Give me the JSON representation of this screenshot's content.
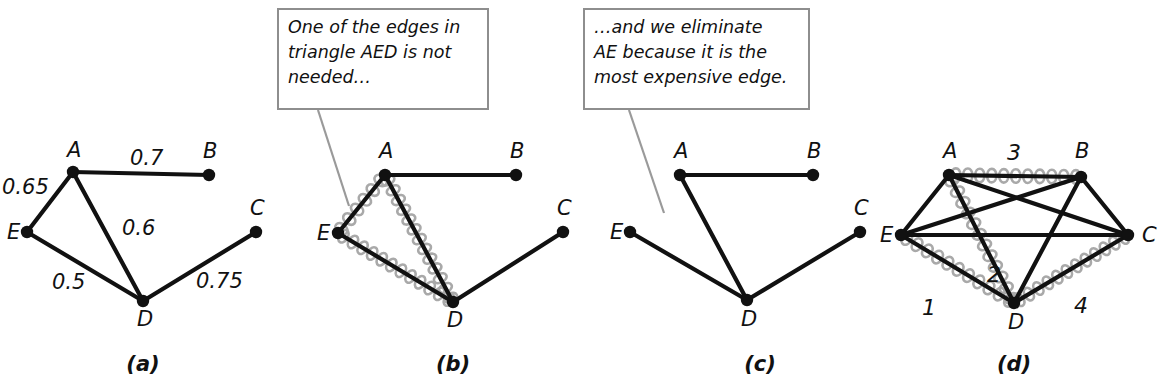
{
  "figure": {
    "caption_labels": [
      {
        "id": "a",
        "text": "(a)",
        "x": 143,
        "y": 371
      },
      {
        "id": "b",
        "text": "(b)",
        "x": 453,
        "y": 371
      },
      {
        "id": "c",
        "text": "(c)",
        "x": 760,
        "y": 371
      },
      {
        "id": "d",
        "text": "(d)",
        "x": 1014,
        "y": 371
      }
    ],
    "callouts": [
      {
        "id": "callout-aed",
        "text": "One of the edges in\ntriangle AED is not\nneeded…",
        "box": {
          "x": 277,
          "y": 8,
          "w": 212,
          "h": 102
        },
        "leader": {
          "x1": 318,
          "y1": 110,
          "x2": 349,
          "y2": 206
        }
      },
      {
        "id": "callout-ae",
        "text": "…and we eliminate\nAE because it is the\nmost expensive edge.",
        "box": {
          "x": 583,
          "y": 8,
          "w": 227,
          "h": 102
        },
        "leader": {
          "x1": 629,
          "y1": 110,
          "x2": 664,
          "y2": 213
        }
      }
    ],
    "panels": [
      {
        "id": "panel-a",
        "label": "(a)",
        "nodes": [
          {
            "id": "A",
            "label": "A",
            "x": 73,
            "y": 172,
            "lx": 67,
            "ly": 157
          },
          {
            "id": "B",
            "label": "B",
            "x": 209,
            "y": 175,
            "lx": 203,
            "ly": 158
          },
          {
            "id": "C",
            "label": "C",
            "x": 256,
            "y": 232,
            "lx": 250,
            "ly": 215
          },
          {
            "id": "D",
            "label": "D",
            "x": 143,
            "y": 301,
            "lx": 137,
            "ly": 326
          },
          {
            "id": "E",
            "label": "E",
            "x": 27,
            "y": 232,
            "lx": 7,
            "ly": 239
          }
        ],
        "edges": [
          {
            "from": "A",
            "to": "B",
            "weight": "0.7",
            "wx": 130,
            "wy": 165
          },
          {
            "from": "A",
            "to": "E",
            "weight": "0.65",
            "wx": 2,
            "wy": 194
          },
          {
            "from": "A",
            "to": "D",
            "weight": "0.6",
            "wx": 122,
            "wy": 235
          },
          {
            "from": "E",
            "to": "D",
            "weight": "0.5",
            "wx": 52,
            "wy": 289
          },
          {
            "from": "D",
            "to": "C",
            "weight": "0.75",
            "wx": 196,
            "wy": 288
          }
        ]
      },
      {
        "id": "panel-b",
        "label": "(b)",
        "nodes": [
          {
            "id": "A",
            "label": "A",
            "x": 385,
            "y": 175,
            "lx": 379,
            "ly": 158
          },
          {
            "id": "B",
            "label": "B",
            "x": 516,
            "y": 175,
            "lx": 510,
            "ly": 158
          },
          {
            "id": "C",
            "label": "C",
            "x": 563,
            "y": 232,
            "lx": 557,
            "ly": 215
          },
          {
            "id": "D",
            "label": "D",
            "x": 453,
            "y": 302,
            "lx": 447,
            "ly": 327
          },
          {
            "id": "E",
            "label": "E",
            "x": 338,
            "y": 233,
            "lx": 317,
            "ly": 240
          }
        ],
        "edges": [
          {
            "from": "A",
            "to": "B",
            "weight": "",
            "wx": 0,
            "wy": 0
          },
          {
            "from": "A",
            "to": "E",
            "weight": "",
            "wx": 0,
            "wy": 0
          },
          {
            "from": "A",
            "to": "D",
            "weight": "",
            "wx": 0,
            "wy": 0
          },
          {
            "from": "E",
            "to": "D",
            "weight": "",
            "wx": 0,
            "wy": 0
          },
          {
            "from": "D",
            "to": "C",
            "weight": "",
            "wx": 0,
            "wy": 0
          }
        ],
        "highlighted_edges": [
          {
            "from": "A",
            "to": "E"
          },
          {
            "from": "A",
            "to": "D"
          },
          {
            "from": "E",
            "to": "D"
          }
        ]
      },
      {
        "id": "panel-c",
        "label": "(c)",
        "nodes": [
          {
            "id": "A",
            "label": "A",
            "x": 680,
            "y": 175,
            "lx": 674,
            "ly": 158
          },
          {
            "id": "B",
            "label": "B",
            "x": 813,
            "y": 175,
            "lx": 807,
            "ly": 158
          },
          {
            "id": "C",
            "label": "C",
            "x": 860,
            "y": 232,
            "lx": 854,
            "ly": 215
          },
          {
            "id": "D",
            "label": "D",
            "x": 747,
            "y": 300,
            "lx": 741,
            "ly": 326
          },
          {
            "id": "E",
            "label": "E",
            "x": 630,
            "y": 232,
            "lx": 610,
            "ly": 239
          }
        ],
        "edges": [
          {
            "from": "A",
            "to": "B",
            "weight": "",
            "wx": 0,
            "wy": 0
          },
          {
            "from": "A",
            "to": "D",
            "weight": "",
            "wx": 0,
            "wy": 0
          },
          {
            "from": "E",
            "to": "D",
            "weight": "",
            "wx": 0,
            "wy": 0
          },
          {
            "from": "D",
            "to": "C",
            "weight": "",
            "wx": 0,
            "wy": 0
          }
        ]
      },
      {
        "id": "panel-d",
        "label": "(d)",
        "nodes": [
          {
            "id": "A",
            "label": "A",
            "x": 949,
            "y": 175,
            "lx": 943,
            "ly": 158
          },
          {
            "id": "B",
            "label": "B",
            "x": 1081,
            "y": 177,
            "lx": 1075,
            "ly": 158
          },
          {
            "id": "C",
            "label": "C",
            "x": 1128,
            "y": 235,
            "lx": 1142,
            "ly": 242
          },
          {
            "id": "D",
            "label": "D",
            "x": 1014,
            "y": 303,
            "lx": 1008,
            "ly": 329
          },
          {
            "id": "E",
            "label": "E",
            "x": 901,
            "y": 235,
            "lx": 880,
            "ly": 242
          }
        ],
        "edges": [
          {
            "from": "A",
            "to": "B",
            "weight": "",
            "wx": 0,
            "wy": 0
          },
          {
            "from": "A",
            "to": "C",
            "weight": "",
            "wx": 0,
            "wy": 0
          },
          {
            "from": "A",
            "to": "D",
            "weight": "",
            "wx": 0,
            "wy": 0
          },
          {
            "from": "A",
            "to": "E",
            "weight": "",
            "wx": 0,
            "wy": 0
          },
          {
            "from": "B",
            "to": "C",
            "weight": "",
            "wx": 0,
            "wy": 0
          },
          {
            "from": "B",
            "to": "D",
            "weight": "",
            "wx": 0,
            "wy": 0
          },
          {
            "from": "B",
            "to": "E",
            "weight": "",
            "wx": 0,
            "wy": 0
          },
          {
            "from": "C",
            "to": "D",
            "weight": "",
            "wx": 0,
            "wy": 0
          },
          {
            "from": "C",
            "to": "E",
            "weight": "",
            "wx": 0,
            "wy": 0
          },
          {
            "from": "D",
            "to": "E",
            "weight": "",
            "wx": 0,
            "wy": 0
          }
        ],
        "highlighted_edges": [
          {
            "from": "E",
            "to": "D",
            "order": "1",
            "ox": 929,
            "oy": 315
          },
          {
            "from": "A",
            "to": "D",
            "order": "2",
            "ox": 994,
            "oy": 282
          },
          {
            "from": "A",
            "to": "B",
            "order": "3",
            "ox": 1014,
            "oy": 160
          },
          {
            "from": "D",
            "to": "C",
            "order": "4",
            "ox": 1081,
            "oy": 313
          }
        ]
      }
    ]
  }
}
